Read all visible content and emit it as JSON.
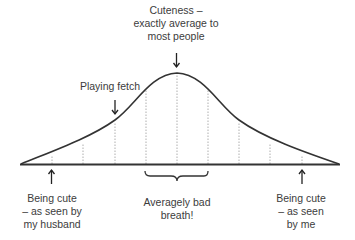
{
  "diagram": {
    "curve_type": "normal-distribution",
    "line_color": "#333333",
    "dotted_color": "#9a9a9a",
    "annotations": {
      "peak": {
        "lines": [
          "Cuteness –",
          "exactly average to",
          "most people"
        ],
        "position": "mean"
      },
      "fetch": {
        "lines": [
          "Playing fetch"
        ],
        "position": "left slope, -1 sd"
      },
      "husband": {
        "lines": [
          "Being cute",
          "– as seen by",
          "my husband"
        ],
        "position": "far left tail"
      },
      "breath": {
        "lines": [
          "Averagely bad",
          "breath!"
        ],
        "position": "middle range (bracket)"
      },
      "me": {
        "lines": [
          "Being cute",
          "– as seen",
          "by me"
        ],
        "position": "far right tail"
      }
    },
    "dotted_lines_count": 9
  }
}
